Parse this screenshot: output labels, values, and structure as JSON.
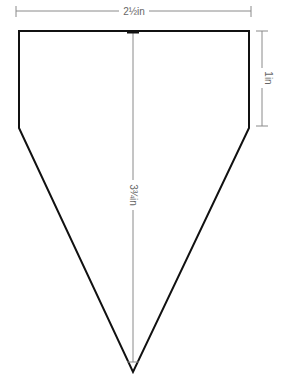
{
  "diagram": {
    "type": "dimensioned-shape",
    "shape": "pentagon-pennant",
    "colors": {
      "outline": "#111111",
      "dimension": "#8a8a8a",
      "label": "#666666",
      "background": "#ffffff"
    },
    "dimensions": {
      "width": {
        "label": "2½in",
        "orientation": "horizontal"
      },
      "side_height": {
        "label": "1in",
        "orientation": "vertical"
      },
      "total_height": {
        "label": "3¾in",
        "orientation": "vertical"
      }
    }
  }
}
